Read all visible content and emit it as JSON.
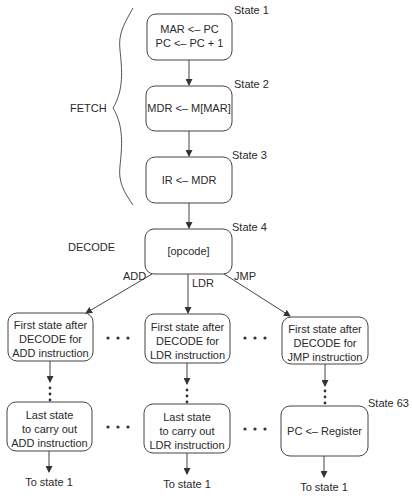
{
  "brace_label": "FETCH",
  "decode_label": "DECODE",
  "states": {
    "s1": {
      "id_label": "State 1",
      "lines": [
        "MAR <– PC",
        "PC <– PC + 1"
      ]
    },
    "s2": {
      "id_label": "State 2",
      "lines": [
        "MDR <– M[MAR]"
      ]
    },
    "s3": {
      "id_label": "State 3",
      "lines": [
        "IR <– MDR"
      ]
    },
    "s4": {
      "id_label": "State 4",
      "lines": [
        "[opcode]"
      ]
    },
    "add_first": {
      "lines": [
        "First state after",
        "DECODE for",
        "ADD instruction"
      ]
    },
    "ldr_first": {
      "lines": [
        "First state after",
        "DECODE for",
        "LDR instruction"
      ]
    },
    "jmp_first": {
      "lines": [
        "First state after",
        "DECODE for",
        "JMP instruction"
      ]
    },
    "add_last": {
      "lines": [
        "Last state",
        "to carry out",
        "ADD instruction"
      ]
    },
    "ldr_last": {
      "lines": [
        "Last state",
        "to carry out",
        "LDR instruction"
      ]
    },
    "s63": {
      "id_label": "State 63",
      "lines": [
        "PC <– Register"
      ]
    }
  },
  "edge_labels": {
    "add": "ADD",
    "ldr": "LDR",
    "jmp": "JMP"
  },
  "exits": {
    "add": "To state 1",
    "ldr": "To state 1",
    "jmp": "To state 1"
  }
}
